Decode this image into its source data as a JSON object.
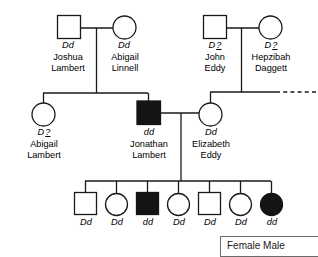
{
  "diagram": {
    "type": "pedigree-chart",
    "generations": [
      {
        "id": "generation-1",
        "individuals": [
          {
            "id": "joshua-lambert",
            "sex": "male",
            "shape": "square",
            "affected": false,
            "genotype": "Dd",
            "genotype_unknown": false,
            "name_line1": "Joshua",
            "name_line2": "Lambert"
          },
          {
            "id": "abigail-linnell",
            "sex": "female",
            "shape": "circle",
            "affected": false,
            "genotype": "Dd",
            "genotype_unknown": false,
            "name_line1": "Abigail",
            "name_line2": "Linnell"
          },
          {
            "id": "john-eddy",
            "sex": "male",
            "shape": "square",
            "affected": false,
            "genotype": "D",
            "genotype_unknown": true,
            "unknown_mark": "?",
            "name_line1": "John",
            "name_line2": "Eddy"
          },
          {
            "id": "hepzibah-daggett",
            "sex": "female",
            "shape": "circle",
            "affected": false,
            "genotype": "D",
            "genotype_unknown": true,
            "unknown_mark": "?",
            "name_line1": "Hepzibah",
            "name_line2": "Daggett"
          }
        ]
      },
      {
        "id": "generation-2",
        "individuals": [
          {
            "id": "abigail-lambert",
            "sex": "female",
            "shape": "circle",
            "affected": false,
            "genotype": "D",
            "genotype_unknown": true,
            "unknown_mark": "?",
            "name_line1": "Abigail",
            "name_line2": "Lambert"
          },
          {
            "id": "jonathan-lambert",
            "sex": "male",
            "shape": "square",
            "affected": true,
            "genotype": "dd",
            "genotype_unknown": false,
            "name_line1": "Jonathan",
            "name_line2": "Lambert"
          },
          {
            "id": "elizabeth-eddy",
            "sex": "female",
            "shape": "circle",
            "affected": false,
            "genotype": "Dd",
            "genotype_unknown": false,
            "name_line1": "Elizabeth",
            "name_line2": "Eddy"
          }
        ]
      },
      {
        "id": "generation-3",
        "individuals": [
          {
            "id": "child-1",
            "sex": "male",
            "shape": "square",
            "affected": false,
            "genotype": "Dd",
            "genotype_unknown": false,
            "name_line1": "",
            "name_line2": ""
          },
          {
            "id": "child-2",
            "sex": "female",
            "shape": "circle",
            "affected": false,
            "genotype": "Dd",
            "genotype_unknown": false,
            "name_line1": "",
            "name_line2": ""
          },
          {
            "id": "child-3",
            "sex": "male",
            "shape": "square",
            "affected": true,
            "genotype": "dd",
            "genotype_unknown": false,
            "name_line1": "",
            "name_line2": ""
          },
          {
            "id": "child-4",
            "sex": "female",
            "shape": "circle",
            "affected": false,
            "genotype": "Dd",
            "genotype_unknown": false,
            "name_line1": "",
            "name_line2": ""
          },
          {
            "id": "child-5",
            "sex": "male",
            "shape": "square",
            "affected": false,
            "genotype": "Dd",
            "genotype_unknown": false,
            "name_line1": "",
            "name_line2": ""
          },
          {
            "id": "child-6",
            "sex": "female",
            "shape": "circle",
            "affected": false,
            "genotype": "Dd",
            "genotype_unknown": false,
            "name_line1": "",
            "name_line2": ""
          },
          {
            "id": "child-7",
            "sex": "female",
            "shape": "circle",
            "affected": true,
            "genotype": "dd",
            "genotype_unknown": false,
            "name_line1": "",
            "name_line2": ""
          }
        ]
      }
    ]
  },
  "labels": {
    "g1": {
      "joshua_geno": "Dd",
      "joshua_name1": "Joshua",
      "joshua_name2": "Lambert",
      "abigail_l_geno": "Dd",
      "abigail_l_name1": "Abigail",
      "abigail_l_name2": "Linnell",
      "john_geno": "D",
      "john_qm": "?",
      "john_name1": "John",
      "john_name2": "Eddy",
      "hepzibah_geno": "D",
      "hepzibah_qm": "?",
      "hepzibah_name1": "Hepzibah",
      "hepzibah_name2": "Daggett"
    },
    "g2": {
      "abigail_geno": "D",
      "abigail_qm": "?",
      "abigail_name1": "Abigail",
      "abigail_name2": "Lambert",
      "jonathan_geno": "dd",
      "jonathan_name1": "Jonathan",
      "jonathan_name2": "Lambert",
      "elizabeth_geno": "Dd",
      "elizabeth_name1": "Elizabeth",
      "elizabeth_name2": "Eddy"
    },
    "g3": {
      "c1_geno": "Dd",
      "c2_geno": "Dd",
      "c3_geno": "dd",
      "c4_geno": "Dd",
      "c5_geno": "Dd",
      "c6_geno": "Dd",
      "c7_geno": "dd"
    }
  },
  "legend": {
    "text": "Female  Male"
  },
  "colors": {
    "line": "#1a1a1a",
    "affected_fill": "#141414",
    "unaffected_fill": "#ffffff",
    "legend_border": "#6b6b6b"
  }
}
